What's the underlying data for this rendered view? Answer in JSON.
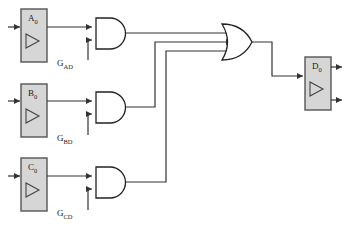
{
  "diagram": {
    "colors": {
      "wire": "#333333",
      "box_fill": "#d6d6d6",
      "box_stroke": "#555555",
      "gate_stroke": "#222222",
      "background": "#ffffff",
      "text": "#1a1a1a"
    },
    "input_buffers": [
      {
        "name": "buffer-a0",
        "label": "A",
        "subscript": "0",
        "symbol": "triangle-buffer"
      },
      {
        "name": "buffer-b0",
        "label": "B",
        "subscript": "0",
        "symbol": "triangle-buffer"
      },
      {
        "name": "buffer-c0",
        "label": "C",
        "subscript": "0",
        "symbol": "triangle-buffer"
      }
    ],
    "and_gates": [
      {
        "name": "and-gate-ad",
        "label": "G",
        "subscript": "AD",
        "inputs": 2
      },
      {
        "name": "and-gate-bd",
        "label": "G",
        "subscript": "BD",
        "inputs": 2
      },
      {
        "name": "and-gate-cd",
        "label": "G",
        "subscript": "CD",
        "inputs": 2
      }
    ],
    "or_gate": {
      "name": "or-gate",
      "label": "",
      "inputs": 3
    },
    "output_buffer": {
      "name": "buffer-d0",
      "label": "D",
      "subscript": "0",
      "symbol": "triangle-buffer",
      "outputs": 2
    }
  }
}
